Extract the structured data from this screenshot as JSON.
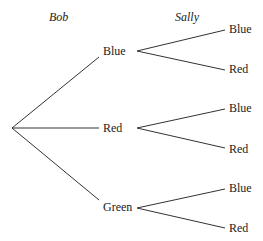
{
  "headers": {
    "stage1": "Bob",
    "stage2": "Sally"
  },
  "tree": {
    "bob": [
      {
        "label": "Blue",
        "sally": [
          "Blue",
          "Red"
        ]
      },
      {
        "label": "Red",
        "sally": [
          "Blue",
          "Red"
        ]
      },
      {
        "label": "Green",
        "sally": [
          "Blue",
          "Red"
        ]
      }
    ]
  }
}
